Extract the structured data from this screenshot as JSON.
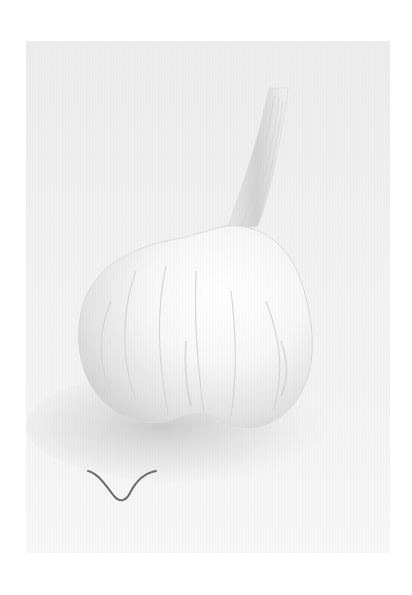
{
  "image": {
    "subject": "garlic bulb",
    "description": "A single white garlic bulb with a tall dried stem on a pale grey-white background, soft shadow beneath, small curled root on the lower left.",
    "colors": {
      "background": "#f0f0f0",
      "bulb": "#f7f7f7",
      "bulb_shade": "#d6d6d6",
      "shadow": "#c9c9c9",
      "root": "#6b6b6b",
      "page": "#ffffff"
    }
  }
}
